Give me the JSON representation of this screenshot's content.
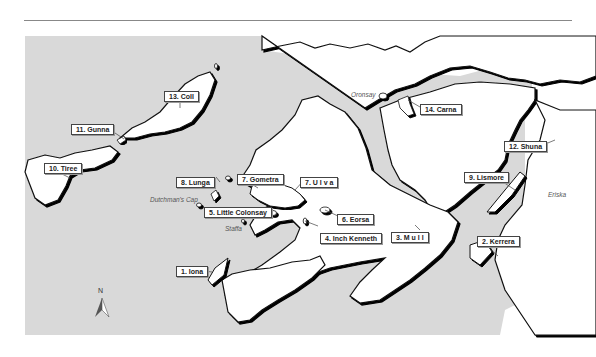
{
  "map": {
    "colors": {
      "sea": "#d9d9d9",
      "land": "#ffffff",
      "coast": "#111111",
      "label_border": "#444444"
    },
    "north_arrow": {
      "label": "N"
    },
    "islands": [
      {
        "id": "iona",
        "label": "1. Iona"
      },
      {
        "id": "kerrera",
        "label": "2. Kerrera"
      },
      {
        "id": "mull",
        "label": "3. M u l l"
      },
      {
        "id": "inch-kenneth",
        "label": "4. Inch Kenneth"
      },
      {
        "id": "little-colonsay",
        "label": "5. Little Colonsay"
      },
      {
        "id": "eorsa",
        "label": "6. Eorsa"
      },
      {
        "id": "gometra",
        "label": "7. Gometra"
      },
      {
        "id": "ulva",
        "label": "7. U l v a"
      },
      {
        "id": "lunga",
        "label": "8. Lunga"
      },
      {
        "id": "lismore",
        "label": "9. Lismore"
      },
      {
        "id": "tiree",
        "label": "10. Tiree"
      },
      {
        "id": "gunna",
        "label": "11. Gunna"
      },
      {
        "id": "shuna",
        "label": "12. Shuna"
      },
      {
        "id": "coll",
        "label": "13. Coll"
      },
      {
        "id": "carna",
        "label": "14. Carna"
      }
    ],
    "minor_labels": {
      "dutchmans_cap": "Dutchman's Cap",
      "staffa": "Staffa",
      "oronsay": "Oronsay",
      "eriska": "Eriska"
    }
  }
}
